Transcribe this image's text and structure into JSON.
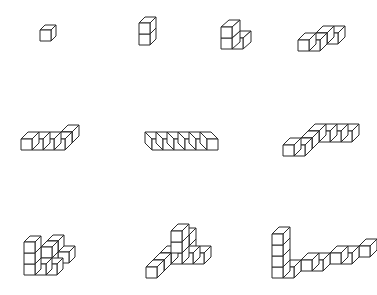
{
  "diagram": {
    "stroke_color": "#2a2a2a",
    "fill_color": "#ffffff",
    "background": "#ffffff",
    "cube_size": 11,
    "figures": [
      {
        "id": "fig-1",
        "name": "single-cube",
        "cube_count": 1,
        "origin": [
          40,
          41
        ],
        "depth": [
          5,
          -5
        ],
        "cubes": [
          [
            0,
            0,
            0
          ]
        ]
      },
      {
        "id": "fig-2",
        "name": "two-cube-tower",
        "cube_count": 2,
        "origin": [
          139,
          45
        ],
        "depth": [
          6,
          -6
        ],
        "cubes": [
          [
            0,
            0,
            0
          ],
          [
            0,
            1,
            0
          ]
        ]
      },
      {
        "id": "fig-3",
        "name": "three-cube-l",
        "cube_count": 3,
        "origin": [
          221,
          49
        ],
        "depth": [
          8,
          -7
        ],
        "cubes": [
          [
            0,
            0,
            0
          ],
          [
            1,
            0,
            0
          ],
          [
            0,
            1,
            0
          ]
        ]
      },
      {
        "id": "fig-4",
        "name": "four-cube-s",
        "cube_count": 4,
        "origin": [
          298,
          51
        ],
        "depth": [
          7,
          -7
        ],
        "cubes": [
          [
            1,
            0,
            1
          ],
          [
            2,
            0,
            1
          ],
          [
            0,
            0,
            0
          ],
          [
            1,
            0,
            0
          ]
        ]
      },
      {
        "id": "fig-5",
        "name": "five-cube-row-with-back",
        "cube_count": 5,
        "origin": [
          21,
          150
        ],
        "depth": [
          7,
          -7
        ],
        "cubes": [
          [
            3,
            0,
            1
          ],
          [
            0,
            0,
            0
          ],
          [
            1,
            0,
            0
          ],
          [
            2,
            0,
            0
          ],
          [
            3,
            0,
            0
          ]
        ]
      },
      {
        "id": "fig-6",
        "name": "six-cube-bar",
        "cube_count": 6,
        "origin": [
          152,
          150
        ],
        "depth": [
          -7,
          -7
        ],
        "cubes": [
          [
            0,
            0,
            0
          ],
          [
            1,
            0,
            0
          ],
          [
            2,
            0,
            0
          ],
          [
            3,
            0,
            0
          ],
          [
            4,
            0,
            0
          ],
          [
            5,
            0,
            0
          ]
        ]
      },
      {
        "id": "fig-7",
        "name": "seven-cube-step-z",
        "cube_count": 7,
        "origin": [
          283,
          156
        ],
        "depth": [
          7,
          -7
        ],
        "cubes": [
          [
            1,
            0,
            2
          ],
          [
            2,
            0,
            2
          ],
          [
            3,
            0,
            2
          ],
          [
            4,
            0,
            2
          ],
          [
            1,
            0,
            1
          ],
          [
            0,
            0,
            0
          ],
          [
            1,
            0,
            0
          ]
        ]
      },
      {
        "id": "fig-8",
        "name": "eight-cube-staircase",
        "cube_count": 8,
        "origin": [
          24,
          275
        ],
        "depth": [
          6,
          -6
        ],
        "cubes": [
          [
            2,
            0,
            2
          ],
          [
            1,
            1,
            2
          ],
          [
            1,
            0,
            1
          ],
          [
            1,
            1,
            1
          ],
          [
            0,
            0,
            0
          ],
          [
            1,
            0,
            0
          ],
          [
            2,
            0,
            0
          ],
          [
            0,
            1,
            0
          ],
          [
            0,
            2,
            0
          ]
        ]
      },
      {
        "id": "fig-9",
        "name": "nine-cube-tripod",
        "cube_count": 9,
        "origin": [
          146,
          278
        ],
        "depth": [
          7,
          -7
        ],
        "cubes": [
          [
            1,
            0,
            3
          ],
          [
            1,
            1,
            3
          ],
          [
            2,
            0,
            2
          ],
          [
            3,
            0,
            2
          ],
          [
            0,
            0,
            2
          ],
          [
            1,
            0,
            2
          ],
          [
            1,
            1,
            2
          ],
          [
            1,
            2,
            2
          ],
          [
            0,
            0,
            1
          ],
          [
            0,
            0,
            0
          ]
        ]
      },
      {
        "id": "fig-10",
        "name": "ten-cube-l-staircase",
        "cube_count": 10,
        "origin": [
          272,
          278
        ],
        "depth": [
          7,
          -7
        ],
        "cubes": [
          [
            0,
            0,
            0
          ],
          [
            0,
            1,
            0
          ],
          [
            0,
            2,
            0
          ],
          [
            0,
            3,
            0
          ],
          [
            1,
            0,
            0
          ],
          [
            2,
            0,
            1
          ],
          [
            3,
            0,
            1
          ],
          [
            4,
            0,
            2
          ],
          [
            5,
            0,
            2
          ],
          [
            6,
            0,
            3
          ]
        ]
      }
    ]
  }
}
